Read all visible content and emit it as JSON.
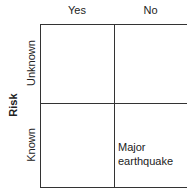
{
  "columns": [
    {
      "label": "Yes"
    },
    {
      "label": "No"
    }
  ],
  "rows": [
    {
      "label": "Unknown"
    },
    {
      "label": "Known"
    }
  ],
  "row_axis_label": "Risk",
  "cells": {
    "known_no": {
      "line1": "Major",
      "line2": "earthquake"
    }
  }
}
